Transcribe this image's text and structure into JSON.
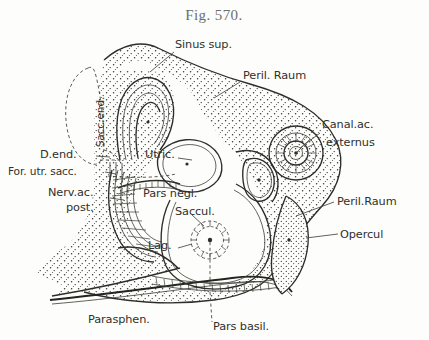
{
  "figure": {
    "title": "Fig. 570.",
    "background_color": "#fdfdfb",
    "ink_color": "#2d2d29"
  },
  "labels": [
    {
      "id": "sinus-sup",
      "text": "Sinus sup.",
      "x": 175,
      "y": 48,
      "anchor": "start",
      "rotated": false
    },
    {
      "id": "peril-raum-upper",
      "text": "Peril. Raum",
      "x": 243,
      "y": 79,
      "anchor": "start",
      "rotated": false
    },
    {
      "id": "canal-ac-line1",
      "text": "Canal.ac.",
      "x": 322,
      "y": 128,
      "anchor": "start",
      "rotated": false
    },
    {
      "id": "canal-ac-line2",
      "text": "externus",
      "x": 326,
      "y": 146,
      "anchor": "start",
      "rotated": false
    },
    {
      "id": "sacc-end",
      "text": "Sacc.end.",
      "x": 104,
      "y": 122,
      "anchor": "middle",
      "rotated": true
    },
    {
      "id": "d-end",
      "text": "D.end.",
      "x": 40,
      "y": 158,
      "anchor": "start",
      "rotated": false
    },
    {
      "id": "for-utr-sacc",
      "text": "For. utr. sacc.",
      "x": 8,
      "y": 175,
      "anchor": "start",
      "rotated": false
    },
    {
      "id": "nerv-ac-line1",
      "text": "Nerv.ac.",
      "x": 48,
      "y": 196,
      "anchor": "start",
      "rotated": false
    },
    {
      "id": "nerv-ac-line2",
      "text": "post.",
      "x": 66,
      "y": 211,
      "anchor": "start",
      "rotated": false
    },
    {
      "id": "utric",
      "text": "Utric.",
      "x": 145,
      "y": 158,
      "anchor": "start",
      "rotated": false
    },
    {
      "id": "pars-negl",
      "text": "Pars negl.",
      "x": 143,
      "y": 197,
      "anchor": "start",
      "rotated": false
    },
    {
      "id": "saccul",
      "text": "Saccul.",
      "x": 175,
      "y": 215,
      "anchor": "start",
      "rotated": false
    },
    {
      "id": "lag",
      "text": "Lag.",
      "x": 148,
      "y": 249,
      "anchor": "start",
      "rotated": false
    },
    {
      "id": "peril-raum-lower",
      "text": "Peril.Raum",
      "x": 337,
      "y": 205,
      "anchor": "start",
      "rotated": false
    },
    {
      "id": "opercul",
      "text": "Opercul",
      "x": 340,
      "y": 238,
      "anchor": "start",
      "rotated": false
    },
    {
      "id": "parasphen",
      "text": "Parasphen.",
      "x": 88,
      "y": 323,
      "anchor": "start",
      "rotated": false
    },
    {
      "id": "pars-basil",
      "text": "Pars basil.",
      "x": 213,
      "y": 330,
      "anchor": "start",
      "rotated": false
    }
  ]
}
